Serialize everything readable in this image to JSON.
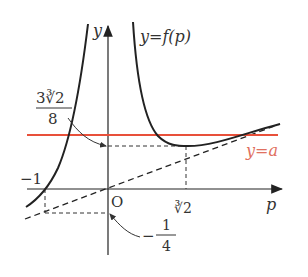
{
  "labels": {
    "y_axis": "y",
    "x_axis": "p",
    "curve": "y=f(p)",
    "line": "y=a",
    "origin": "O",
    "min_label_num": "3∛2",
    "min_label_den": "8",
    "x_min": "∛2",
    "x_neg1": "−1",
    "intercept_sign": "−",
    "intercept_num": "1",
    "intercept_den": "4"
  },
  "colors": {
    "curve": "#222222",
    "line_a": "#e8503a",
    "label_a": "#e07060"
  }
}
